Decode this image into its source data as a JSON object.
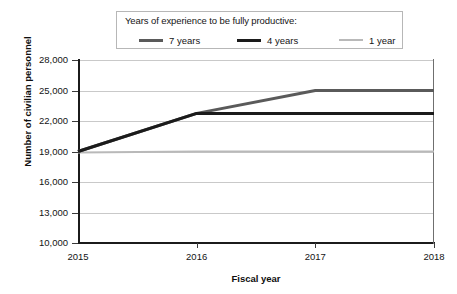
{
  "chart_data": {
    "type": "line",
    "title": "",
    "xlabel": "Fiscal year",
    "ylabel": "Number of civilian personnel",
    "legend_title": "Years of experience to be fully productive:",
    "legend_position": "top",
    "grid": true,
    "x": [
      "2015",
      "2016",
      "2017",
      "2018"
    ],
    "xtick_labels": [
      "2015",
      "2016",
      "2017",
      "2018"
    ],
    "ytick_labels": [
      "28,000",
      "25,000",
      "22,000",
      "19,000",
      "16,000",
      "13,000",
      "10,000"
    ],
    "ytick_values": [
      28000,
      25000,
      22000,
      19000,
      16000,
      13000,
      10000
    ],
    "ylim": [
      10000,
      28000
    ],
    "series": [
      {
        "name": "7 years",
        "color": "#5a5a5a",
        "width": 3,
        "values": [
          19000,
          22750,
          25000,
          25000
        ]
      },
      {
        "name": "4 years",
        "color": "#1b1b1b",
        "width": 3,
        "values": [
          19000,
          22750,
          22750,
          22750
        ]
      },
      {
        "name": "1 year",
        "color": "#b9b9b9",
        "width": 2,
        "values": [
          18900,
          19000,
          19000,
          19000
        ]
      }
    ]
  },
  "legend": {
    "title": "Years of experience to be fully productive:",
    "items": [
      {
        "label": "7 years",
        "color": "#5a5a5a"
      },
      {
        "label": "4 years",
        "color": "#1b1b1b"
      },
      {
        "label": "1 year",
        "color": "#b9b9b9"
      }
    ]
  },
  "axes": {
    "x_title": "Fiscal year",
    "y_title": "Number of civilian personnel",
    "x_ticks": [
      "2015",
      "2016",
      "2017",
      "2018"
    ],
    "y_ticks": [
      "28,000",
      "25,000",
      "22,000",
      "19,000",
      "16,000",
      "13,000",
      "10,000"
    ]
  }
}
